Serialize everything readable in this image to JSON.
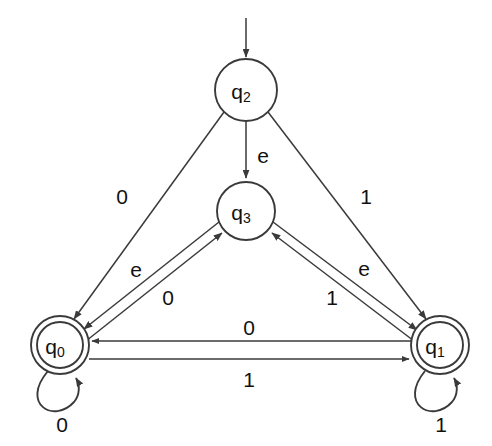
{
  "diagram": {
    "type": "finite-state-machine",
    "title": "",
    "alphabet": [
      "0",
      "1",
      "e"
    ],
    "start_state": "q2",
    "accepting_states": [
      "q0",
      "q1"
    ],
    "states": [
      {
        "id": "q2",
        "base": "q",
        "sub": "2",
        "x": 246,
        "y": 90,
        "r": 31,
        "accepting": false,
        "start": true
      },
      {
        "id": "q3",
        "base": "q",
        "sub": "3",
        "x": 246,
        "y": 211,
        "r": 29,
        "accepting": false,
        "start": false
      },
      {
        "id": "q0",
        "base": "q",
        "sub": "0",
        "x": 60,
        "y": 345,
        "r": 29,
        "accepting": true,
        "start": false
      },
      {
        "id": "q1",
        "base": "q",
        "sub": "1",
        "x": 440,
        "y": 345,
        "r": 29,
        "accepting": true,
        "start": false
      }
    ],
    "transitions": [
      {
        "from": "q2",
        "to": "q0",
        "label": "0",
        "label_x": 122,
        "label_y": 196
      },
      {
        "from": "q2",
        "to": "q1",
        "label": "1",
        "label_x": 366,
        "label_y": 196
      },
      {
        "from": "q2",
        "to": "q3",
        "label": "e",
        "label_x": 263,
        "label_y": 155
      },
      {
        "from": "q3",
        "to": "q0",
        "label": "e",
        "label_x": 136,
        "label_y": 269
      },
      {
        "from": "q0",
        "to": "q3",
        "label": "0",
        "label_x": 168,
        "label_y": 297
      },
      {
        "from": "q3",
        "to": "q1",
        "label": "e",
        "label_x": 364,
        "label_y": 268
      },
      {
        "from": "q1",
        "to": "q3",
        "label": "1",
        "label_x": 332,
        "label_y": 297
      },
      {
        "from": "q1",
        "to": "q0",
        "label": "0",
        "label_x": 249,
        "label_y": 327
      },
      {
        "from": "q0",
        "to": "q1",
        "label": "1",
        "label_x": 249,
        "label_y": 379
      },
      {
        "from": "q0",
        "to": "q0",
        "label": "0",
        "label_x": 62,
        "label_y": 424,
        "self": true
      },
      {
        "from": "q1",
        "to": "q1",
        "label": "1",
        "label_x": 441,
        "label_y": 424,
        "self": true
      }
    ],
    "start_arrow": {
      "from_x": 246,
      "from_y": 18,
      "to_x": 246,
      "to_y": 57
    },
    "colors": {
      "stroke": "#3a3a3a",
      "text": "#111111",
      "background": "#ffffff"
    }
  }
}
